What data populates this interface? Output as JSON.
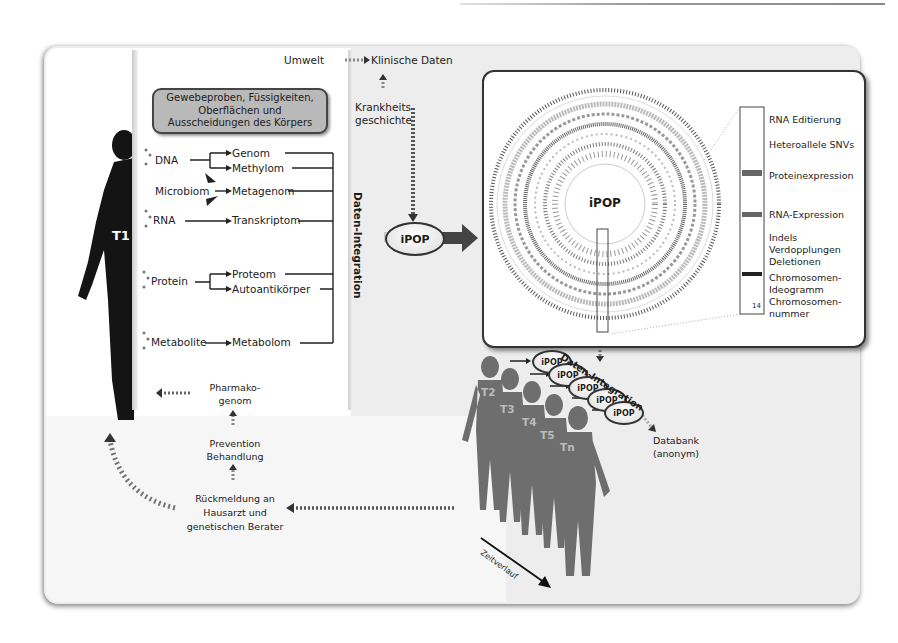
{
  "figure": {
    "subject_label": "T1",
    "sample_box": "Gewebeproben, Füssigkeiten, Oberflächen und Ausscheidungen des Körpers",
    "top": {
      "environment": "Umwelt",
      "clinical_data": "Klinische Daten",
      "disease_history": "Krankheits-geschichte",
      "disease_history_line1": "Krankheits-",
      "disease_history_line2": "geschichte"
    },
    "sources": [
      {
        "name": "DNA",
        "targets": [
          "Genom",
          "Methylom"
        ]
      },
      {
        "name": "Microbiom",
        "targets": [
          "Metagenom"
        ]
      },
      {
        "name": "RNA",
        "targets": [
          "Transkriptom"
        ]
      },
      {
        "name": "Protein",
        "targets": [
          "Proteom",
          "Autoantikörper"
        ]
      },
      {
        "name": "Metabolite",
        "targets": [
          "Metabolom"
        ]
      }
    ],
    "integration_label": "Daten-Integration",
    "ipop_label": "iPOP",
    "circos": {
      "center_label": "iPOP",
      "legend": [
        "RNA Editierung",
        "Heteroallele SNVs",
        "Proteinexpression",
        "RNA-Expression",
        "Indels",
        "Verdopplungen",
        "Deletionen",
        "Chromosomen-",
        "Ideogramm",
        "Chromosomen-",
        "nummer"
      ],
      "chromosome_number": "14"
    },
    "timeline": {
      "subjects": [
        "T2",
        "T3",
        "T4",
        "T5",
        "Tn"
      ],
      "ipop_nodes": [
        "iPOP",
        "iPOP",
        "iPOP",
        "iPOP",
        "iPOP"
      ],
      "integration_label": "Daten-Integration",
      "database_line1": "Databank",
      "database_line2": "(anonym)",
      "time_label": "Zeitverlauf"
    },
    "feedback": {
      "pharmacogenome_line1": "Pharmako-",
      "pharmacogenome_line2": "genom",
      "prevention_line1": "Prevention",
      "prevention_line2": "Behandlung",
      "report_line1": "Rückmeldung an",
      "report_line2": "Hausarzt und",
      "report_line3": "genetischen Berater"
    }
  }
}
